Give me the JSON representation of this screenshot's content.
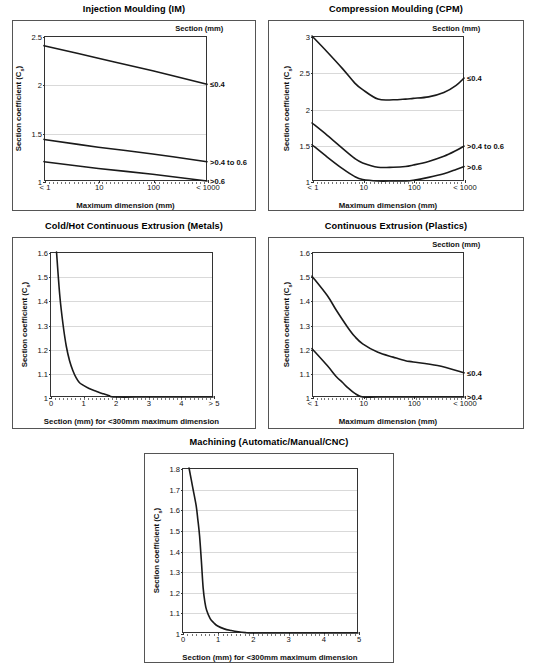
{
  "page": {
    "background": "#ffffff",
    "line_color": "#1a1a1a",
    "grid_color": "#d9d9d9",
    "axis_color": "#333333",
    "panel_border_color": "#555555"
  },
  "panels": [
    {
      "id": "injection-moulding",
      "title": "Injection Moulding (IM)",
      "legend_title": "Section (mm)"
    },
    {
      "id": "compression-moulding",
      "title": "Compression Moulding (CPM)",
      "legend_title": "Section (mm)"
    },
    {
      "id": "cold-hot-continuous-extrusion-metals",
      "title": "Cold/Hot Continuous Extrusion (Metals)",
      "legend_title": ""
    },
    {
      "id": "continuous-extrusion-plastics",
      "title": "Continuous Extrusion (Plastics)",
      "legend_title": "Section (mm)"
    },
    {
      "id": "machining",
      "title": "Machining (Automatic/Manual/CNC)",
      "legend_title": ""
    }
  ],
  "chart_data": [
    {
      "type": "line",
      "id": "injection-moulding",
      "title": "Injection Moulding (IM)",
      "xlabel": "Maximum dimension (mm)",
      "ylabel": "Section coefficient (C s)",
      "xscale": "log",
      "xlim": [
        1,
        1000
      ],
      "ylim": [
        1,
        2.5
      ],
      "yticks": [
        1,
        1.5,
        2,
        2.5
      ],
      "ytick_labels": [
        "1",
        "1.5",
        "2",
        "2.5"
      ],
      "xticks": [
        1,
        10,
        100,
        1000
      ],
      "xtick_labels": [
        "< 1",
        "10",
        "100",
        "< 1000"
      ],
      "grid": true,
      "legend_title": "Section (mm)",
      "legend_position": "right-outside",
      "series": [
        {
          "name": "≤0.4",
          "x": [
            1,
            10,
            100,
            1000
          ],
          "values": [
            2.4,
            2.27,
            2.14,
            2.0
          ]
        },
        {
          "name": ">0.4 to 0.6",
          "x": [
            1,
            10,
            100,
            1000
          ],
          "values": [
            1.43,
            1.35,
            1.28,
            1.2
          ]
        },
        {
          "name": ">0.6",
          "x": [
            1,
            10,
            100,
            1000
          ],
          "values": [
            1.2,
            1.13,
            1.07,
            1.0
          ]
        }
      ]
    },
    {
      "type": "line",
      "id": "compression-moulding",
      "title": "Compression Moulding (CPM)",
      "xlabel": "Maximum dimension (mm)",
      "ylabel": "Section coefficient (C s)",
      "xscale": "log",
      "xlim": [
        1,
        1000
      ],
      "ylim": [
        1,
        3
      ],
      "yticks": [
        1,
        1.5,
        2,
        2.5,
        3
      ],
      "ytick_labels": [
        "1",
        "1.5",
        "2",
        "2.5",
        "3"
      ],
      "xticks": [
        1,
        10,
        100,
        1000
      ],
      "xtick_labels": [
        "< 1",
        "10",
        "100",
        "< 1000"
      ],
      "grid": true,
      "legend_title": "Section (mm)",
      "legend_position": "right-outside",
      "series": [
        {
          "name": "≤0.4",
          "x": [
            1,
            2,
            4,
            7,
            10,
            20,
            40,
            70,
            100,
            200,
            400,
            700,
            1000
          ],
          "values": [
            3.0,
            2.78,
            2.55,
            2.35,
            2.26,
            2.13,
            2.12,
            2.13,
            2.14,
            2.16,
            2.22,
            2.32,
            2.42
          ]
        },
        {
          "name": ">0.4 to 0.6",
          "x": [
            1,
            2,
            4,
            7,
            10,
            20,
            40,
            70,
            100,
            200,
            400,
            700,
            1000
          ],
          "values": [
            1.8,
            1.63,
            1.45,
            1.31,
            1.25,
            1.19,
            1.19,
            1.2,
            1.22,
            1.27,
            1.34,
            1.42,
            1.48
          ]
        },
        {
          "name": ">0.6",
          "x": [
            1,
            2,
            4,
            7,
            10,
            20,
            40,
            70,
            100,
            200,
            400,
            700,
            1000
          ],
          "values": [
            1.5,
            1.33,
            1.17,
            1.06,
            1.02,
            1.0,
            1.0,
            1.0,
            1.01,
            1.05,
            1.1,
            1.16,
            1.2
          ]
        }
      ]
    },
    {
      "type": "line",
      "id": "cold-hot-continuous-extrusion-metals",
      "title": "Cold/Hot Continuous Extrusion (Metals)",
      "xlabel": "Section (mm) for <300mm maximum dimension",
      "ylabel": "Section coefficient (C s)",
      "xscale": "linear",
      "xlim": [
        0,
        5
      ],
      "ylim": [
        1,
        1.6
      ],
      "yticks": [
        1,
        1.1,
        1.2,
        1.3,
        1.4,
        1.5,
        1.6
      ],
      "ytick_labels": [
        "1",
        "1.1",
        "1.2",
        "1.3",
        "1.4",
        "1.5",
        "1.6"
      ],
      "xticks": [
        0,
        1,
        2,
        3,
        4,
        5
      ],
      "xtick_labels": [
        "0",
        "1",
        "2",
        "3",
        "4",
        "> 5"
      ],
      "grid": true,
      "series": [
        {
          "name": "metals",
          "x": [
            0.2,
            0.3,
            0.4,
            0.5,
            0.6,
            0.7,
            0.8,
            0.9,
            1.0,
            1.2,
            1.4,
            1.6,
            1.8,
            2.0,
            3.0,
            4.0,
            5.0
          ],
          "values": [
            1.6,
            1.42,
            1.3,
            1.21,
            1.15,
            1.11,
            1.08,
            1.06,
            1.05,
            1.035,
            1.025,
            1.015,
            1.006,
            1.0,
            1.0,
            1.0,
            1.0
          ]
        }
      ]
    },
    {
      "type": "line",
      "id": "continuous-extrusion-plastics",
      "title": "Continuous Extrusion (Plastics)",
      "xlabel": "Maximum dimension (mm)",
      "ylabel": "Section coefficient (C s)",
      "xscale": "log",
      "xlim": [
        1,
        1000
      ],
      "ylim": [
        1,
        1.6
      ],
      "yticks": [
        1,
        1.1,
        1.2,
        1.3,
        1.4,
        1.5,
        1.6
      ],
      "ytick_labels": [
        "1",
        "1.1",
        "1.2",
        "1.3",
        "1.4",
        "1.5",
        "1.6"
      ],
      "xticks": [
        1,
        10,
        100,
        1000
      ],
      "xtick_labels": [
        "< 1",
        "10",
        "100",
        "< 1000"
      ],
      "grid": true,
      "legend_title": "Section (mm)",
      "legend_position": "right-outside",
      "series": [
        {
          "name": "≤0.4",
          "x": [
            1,
            2,
            3,
            5,
            7,
            10,
            20,
            40,
            70,
            100,
            300,
            1000
          ],
          "values": [
            1.5,
            1.42,
            1.36,
            1.29,
            1.25,
            1.22,
            1.185,
            1.165,
            1.15,
            1.145,
            1.13,
            1.1
          ]
        },
        {
          "name": ">0.4",
          "x": [
            1,
            2,
            3,
            4,
            5,
            7,
            10,
            20,
            100,
            1000
          ],
          "values": [
            1.2,
            1.13,
            1.085,
            1.06,
            1.04,
            1.015,
            1.0,
            1.0,
            1.0,
            1.0
          ]
        }
      ]
    },
    {
      "type": "line",
      "id": "machining",
      "title": "Machining (Automatic/Manual/CNC)",
      "xlabel": "Section (mm) for <300mm maximum dimension",
      "ylabel": "Section coefficient (C s)",
      "xscale": "linear",
      "xlim": [
        0,
        5
      ],
      "ylim": [
        1,
        1.8
      ],
      "yticks": [
        1,
        1.1,
        1.2,
        1.3,
        1.4,
        1.5,
        1.6,
        1.7,
        1.8
      ],
      "ytick_labels": [
        "1",
        "1.1",
        "1.2",
        "1.3",
        "1.4",
        "1.5",
        "1.6",
        "1.7",
        "1.8"
      ],
      "xticks": [
        0,
        1,
        2,
        3,
        4,
        5
      ],
      "xtick_labels": [
        "0",
        "1",
        "2",
        "3",
        "4",
        "5"
      ],
      "grid": true,
      "series": [
        {
          "name": "machining",
          "x": [
            0.2,
            0.3,
            0.4,
            0.45,
            0.5,
            0.55,
            0.6,
            0.65,
            0.7,
            0.8,
            0.9,
            1.0,
            1.2,
            1.4,
            1.6,
            1.8,
            2.0,
            3.0,
            4.0,
            5.0
          ],
          "values": [
            1.8,
            1.71,
            1.62,
            1.55,
            1.47,
            1.35,
            1.22,
            1.15,
            1.11,
            1.07,
            1.05,
            1.035,
            1.02,
            1.012,
            1.006,
            1.002,
            1.0,
            1.0,
            1.0,
            1.0
          ]
        }
      ]
    }
  ]
}
